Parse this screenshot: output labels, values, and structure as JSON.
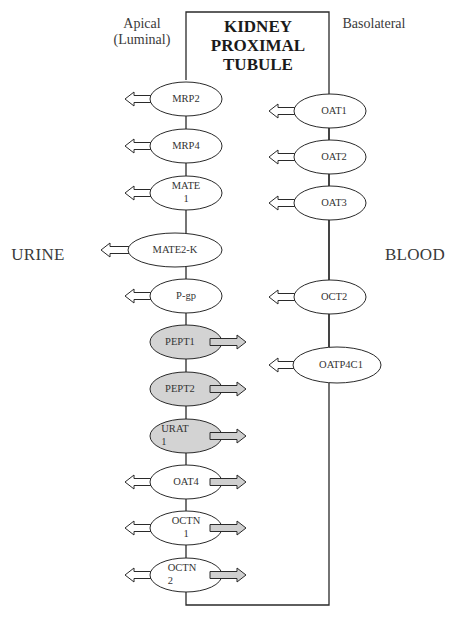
{
  "title": {
    "lines": [
      "KIDNEY",
      "PROXIMAL",
      "TUBULE"
    ]
  },
  "labels": {
    "apical": "Apical",
    "apical_sub": "(Luminal)",
    "basolateral": "Basolateral",
    "urine": "URINE",
    "blood": "BLOOD"
  },
  "colors": {
    "outline": "#2a2a2a",
    "efflux_fill": "#ffffff",
    "influx_fill": "#d3d3d3"
  },
  "apical_transporters": [
    {
      "name": "MRP2",
      "lines": [
        "MRP2"
      ],
      "filled": false,
      "arrows": [
        "out-left"
      ]
    },
    {
      "name": "MRP4",
      "lines": [
        "MRP4"
      ],
      "filled": false,
      "arrows": [
        "out-left"
      ]
    },
    {
      "name": "MATE1",
      "lines": [
        "MATE",
        "1"
      ],
      "filled": false,
      "arrows": [
        "out-left"
      ]
    },
    {
      "name": "MATE2-K",
      "lines": [
        "MATE2-K"
      ],
      "filled": false,
      "arrows": [
        "out-left"
      ]
    },
    {
      "name": "P-gp",
      "lines": [
        "P-gp"
      ],
      "filled": false,
      "arrows": [
        "out-left"
      ]
    },
    {
      "name": "PEPT1",
      "lines": [
        "PEPT1"
      ],
      "filled": true,
      "arrows": [
        "in-right"
      ]
    },
    {
      "name": "PEPT2",
      "lines": [
        "PEPT2"
      ],
      "filled": true,
      "arrows": [
        "in-right"
      ]
    },
    {
      "name": "URAT1",
      "lines": [
        "URAT",
        "1"
      ],
      "filled": true,
      "arrows": [
        "in-right"
      ]
    },
    {
      "name": "OAT4",
      "lines": [
        "OAT4"
      ],
      "filled": false,
      "arrows": [
        "out-left",
        "in-right"
      ]
    },
    {
      "name": "OCTN1",
      "lines": [
        "OCTN",
        "1"
      ],
      "filled": false,
      "arrows": [
        "out-left",
        "in-right"
      ]
    },
    {
      "name": "OCTN2",
      "lines": [
        "OCTN",
        "2"
      ],
      "filled": false,
      "arrows": [
        "out-left",
        "in-right"
      ]
    }
  ],
  "basolateral_transporters": [
    {
      "name": "OAT1",
      "lines": [
        "OAT1"
      ],
      "arrows": [
        "in-left"
      ]
    },
    {
      "name": "OAT2",
      "lines": [
        "OAT2"
      ],
      "arrows": [
        "in-left"
      ]
    },
    {
      "name": "OAT3",
      "lines": [
        "OAT3"
      ],
      "arrows": [
        "in-left"
      ]
    },
    {
      "name": "OCT2",
      "lines": [
        "OCT2"
      ],
      "arrows": [
        "in-left"
      ]
    },
    {
      "name": "OATP4C1",
      "lines": [
        "OATP4C1"
      ],
      "arrows": [
        "in-left"
      ]
    }
  ]
}
